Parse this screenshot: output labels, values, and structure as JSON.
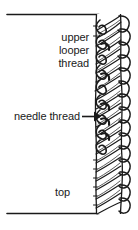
{
  "diagram": {
    "background_color": "#ffffff",
    "ink_color": "#1a1a1a",
    "fabric_fill": "#ffffff",
    "labels": {
      "upper_looper_thread_line1": "upper",
      "upper_looper_thread_line2": "looper",
      "upper_looper_thread_line3": "thread",
      "needle_thread": "needle thread",
      "top": "top"
    },
    "annotations": [
      {
        "name": "needle-thread-pointer",
        "type": "arrow",
        "direction": "right",
        "from_x": 82,
        "to_x": 97,
        "y": 116
      }
    ],
    "guides": [
      {
        "name": "fabric-top-edge",
        "type": "horizontal-line",
        "x1": 6,
        "x2": 100,
        "y": 14
      },
      {
        "name": "fabric-bottom-edge",
        "type": "horizontal-line",
        "x1": 6,
        "x2": 100,
        "y": 214
      }
    ],
    "stitch_column": {
      "name": "overlock-stitch-column",
      "left": 92,
      "right": 133,
      "top": 14,
      "bottom": 214,
      "loop_count": 13
    }
  }
}
